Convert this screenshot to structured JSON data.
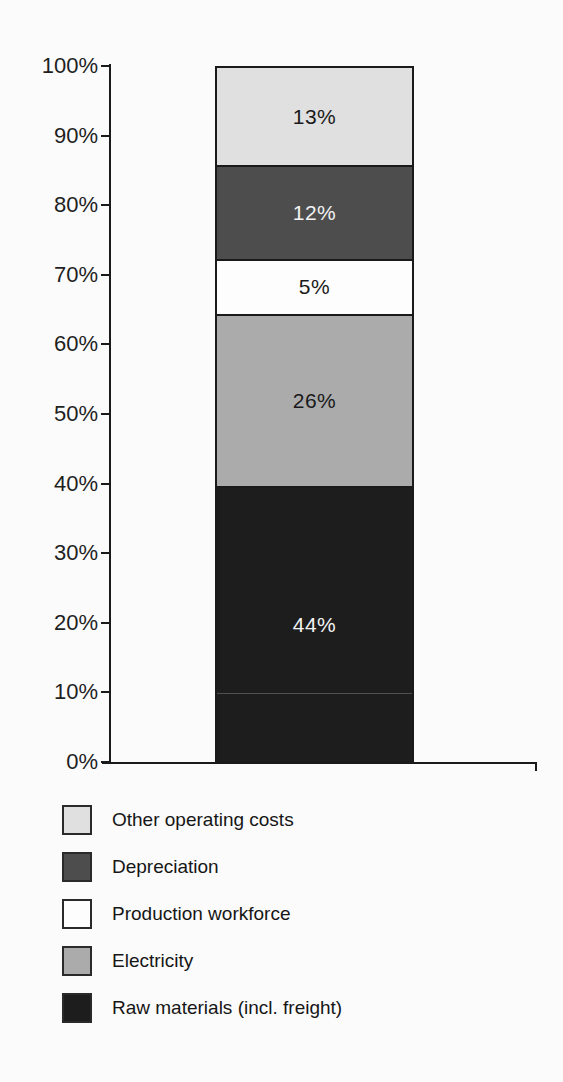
{
  "page": {
    "background_color": "#fbfbfb"
  },
  "chart_data": {
    "type": "bar",
    "variant": "100%-stacked-column",
    "title": "",
    "xlabel": "",
    "ylabel": "",
    "ylim": [
      0,
      100
    ],
    "grid": false,
    "axis_color": "#1a1a1a",
    "y_ticks": [
      {
        "value": 100,
        "label": "100%"
      },
      {
        "value": 90,
        "label": "90%"
      },
      {
        "value": 80,
        "label": "80%"
      },
      {
        "value": 70,
        "label": "70%"
      },
      {
        "value": 60,
        "label": "60%"
      },
      {
        "value": 50,
        "label": "50%"
      },
      {
        "value": 40,
        "label": "40%"
      },
      {
        "value": 30,
        "label": "30%"
      },
      {
        "value": 20,
        "label": "20%"
      },
      {
        "value": 10,
        "label": "10%"
      },
      {
        "value": 0,
        "label": "0%"
      }
    ],
    "segments_top_to_bottom": [
      {
        "name": "Other operating costs",
        "value": 13,
        "data_label": "13%",
        "fill": "#e0e0e0",
        "label_color": "#1a1a1a"
      },
      {
        "name": "Depreciation",
        "value": 12,
        "data_label": "12%",
        "fill": "#4d4d4d",
        "label_color": "#f2f2f2"
      },
      {
        "name": "Production workforce",
        "value": 5,
        "data_label": "5%",
        "fill": "#fdfdfd",
        "label_color": "#1a1a1a"
      },
      {
        "name": "Electricity",
        "value": 26,
        "data_label": "26%",
        "fill": "#ababab",
        "label_color": "#1a1a1a"
      },
      {
        "name": "Raw materials (incl. freight)",
        "value": 44,
        "data_label": "44%",
        "fill": "#1d1d1d",
        "label_color": "#f2f2f2"
      }
    ],
    "legend": {
      "position": "bottom-left",
      "entries": [
        {
          "label": "Other operating costs",
          "swatch_color": "#e0e0e0"
        },
        {
          "label": "Depreciation",
          "swatch_color": "#4d4d4d"
        },
        {
          "label": "Production workforce",
          "swatch_color": "#fdfdfd"
        },
        {
          "label": "Electricity",
          "swatch_color": "#ababab"
        },
        {
          "label": "Raw materials (incl. freight)",
          "swatch_color": "#1d1d1d"
        }
      ]
    }
  }
}
